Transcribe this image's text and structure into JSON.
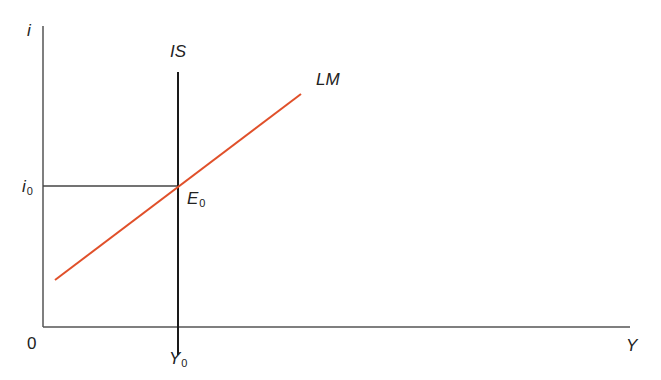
{
  "diagram": {
    "type": "IS-LM diagram",
    "axes": {
      "y_label": "i",
      "x_label": "Y",
      "origin_label": "0"
    },
    "curves": [
      {
        "name": "IS",
        "label": "IS",
        "shape": "vertical",
        "color": "#1a1a1a"
      },
      {
        "name": "LM",
        "label": "LM",
        "shape": "upward-sloping",
        "color": "#e0502a"
      }
    ],
    "equilibrium": {
      "point_label": "E",
      "point_subscript": "0",
      "interest_label": "i",
      "interest_subscript": "0",
      "output_label": "Y",
      "output_subscript": "0"
    },
    "colors": {
      "axis": "#555555",
      "is_curve": "#1a1a1a",
      "lm_curve": "#e0502a",
      "guide_line": "#444444",
      "text": "#222222"
    }
  }
}
